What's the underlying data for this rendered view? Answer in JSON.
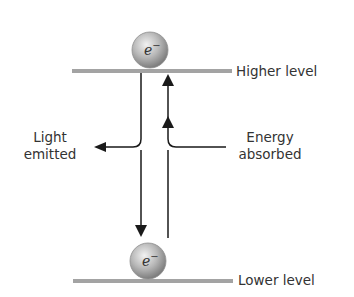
{
  "diagram": {
    "type": "energy-level-transition",
    "levels": {
      "higher": {
        "label": "Higher level"
      },
      "lower": {
        "label": "Lower level"
      }
    },
    "electron_symbol": "e",
    "electron_charge": "−",
    "arrows": {
      "emission": {
        "label_line1": "Light",
        "label_line2": "emitted",
        "direction": "down"
      },
      "absorption": {
        "label_line1": "Energy",
        "label_line2": "absorbed",
        "direction": "up"
      }
    },
    "colors": {
      "level_line": "#a3a3a3",
      "arrow": "#1a1a1a",
      "electron_light": "#e6e6e6",
      "electron_dark": "#8a8a8a",
      "text": "#333333"
    }
  }
}
